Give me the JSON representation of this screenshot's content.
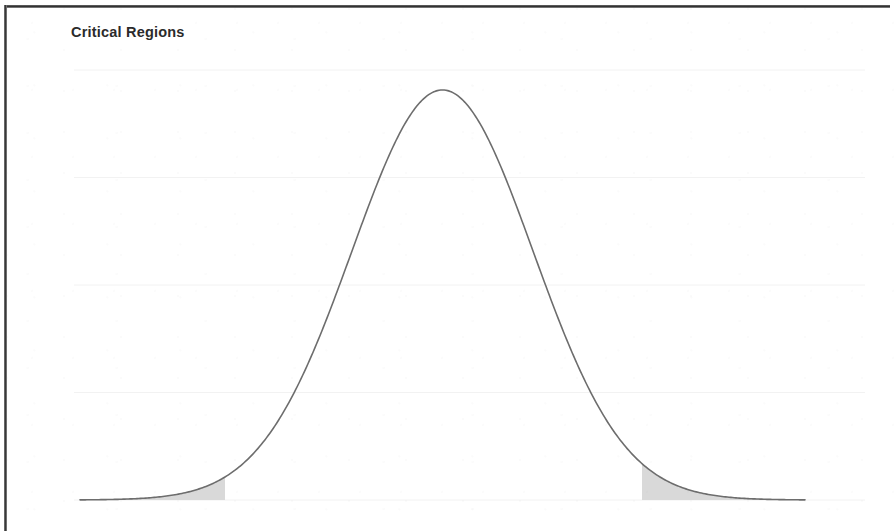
{
  "figure": {
    "title": "Critical Regions",
    "frame_color": "#333333",
    "background": "#ffffff"
  },
  "chart_data": {
    "type": "area",
    "title": "Critical Regions",
    "xlabel": "",
    "ylabel": "",
    "subtitle": "",
    "grid": true,
    "grid_orientation": "horizontal",
    "grid_color": "#f2f2f2",
    "gridline_count": 5,
    "legend": null,
    "legend_position": "none",
    "curve_color": "#6d6d6d",
    "curve_width": 1.6,
    "shade_color": "#d9d9d9",
    "annotations": [],
    "distribution": "normal",
    "mean": 0,
    "stddev": 1,
    "xlim": [
      -4.0,
      4.0
    ],
    "ylim": [
      0,
      0.42
    ],
    "tick_labels_x": [],
    "tick_labels_y": [],
    "critical_regions": [
      {
        "name": "lower-critical-region",
        "from": -4.0,
        "to": -2.4,
        "shaded": true
      },
      {
        "name": "upper-critical-region",
        "from": 2.2,
        "to": 4.0,
        "shaded": true
      }
    ],
    "x": [
      -4.0,
      -3.8,
      -3.6,
      -3.4,
      -3.2,
      -3.0,
      -2.8,
      -2.6,
      -2.4,
      -2.2,
      -2.0,
      -1.8,
      -1.6,
      -1.4,
      -1.2,
      -1.0,
      -0.8,
      -0.6,
      -0.4,
      -0.2,
      0.0,
      0.2,
      0.4,
      0.6,
      0.8,
      1.0,
      1.2,
      1.4,
      1.6,
      1.8,
      2.0,
      2.2,
      2.4,
      2.6,
      2.8,
      3.0,
      3.2,
      3.4,
      3.6,
      3.8,
      4.0
    ],
    "y": [
      0.0001,
      0.0003,
      0.0006,
      0.0012,
      0.0024,
      0.0044,
      0.0079,
      0.0136,
      0.0224,
      0.0355,
      0.054,
      0.079,
      0.1109,
      0.1497,
      0.1942,
      0.242,
      0.2897,
      0.3332,
      0.3683,
      0.391,
      0.3989,
      0.391,
      0.3683,
      0.3332,
      0.2897,
      0.242,
      0.1942,
      0.1497,
      0.1109,
      0.079,
      0.054,
      0.0355,
      0.0224,
      0.0136,
      0.0079,
      0.0044,
      0.0024,
      0.0012,
      0.0006,
      0.0003,
      0.0001
    ]
  }
}
